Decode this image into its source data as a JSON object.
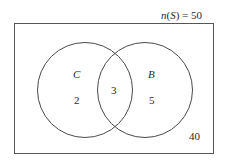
{
  "diagram": {
    "type": "venn",
    "universe_label": "n(S) = 50",
    "universe_label_parts": {
      "n": "n",
      "open": "(",
      "set": "S",
      "close": ")",
      "eq": " = 50"
    },
    "sets": [
      {
        "name": "C",
        "only_count": "2"
      },
      {
        "name": "B",
        "only_count": "5"
      }
    ],
    "intersection_count": "3",
    "outside_count": "40",
    "colors": {
      "stroke": "#4a4a4a",
      "text": "#2a2a2a",
      "background": "#ffffff"
    }
  }
}
